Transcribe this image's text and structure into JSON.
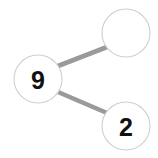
{
  "diagram": {
    "kind": "number-bond",
    "background_color": "#ffffff",
    "circle_fill": "#ffffff",
    "circle_stroke": "#cfcfcf",
    "connector_color": "#9a9a9a",
    "text_color": "#111111",
    "nodes": [
      {
        "id": "whole",
        "role": "whole",
        "label": "9",
        "filled": true,
        "cx": 38,
        "cy": 79,
        "r": 24
      },
      {
        "id": "part-top",
        "role": "part",
        "label": "",
        "filled": false,
        "cx": 126,
        "cy": 33,
        "r": 24
      },
      {
        "id": "part-bottom",
        "role": "part",
        "label": "2",
        "filled": true,
        "cx": 126,
        "cy": 126,
        "r": 24
      }
    ],
    "connectors": [
      {
        "id": "whole-to-part-top",
        "from": "whole",
        "to": "part-top",
        "x1": 58,
        "y1": 66,
        "x2": 107,
        "y2": 47
      },
      {
        "id": "whole-to-part-bottom",
        "from": "whole",
        "to": "part-bottom",
        "x1": 58,
        "y1": 92,
        "x2": 107,
        "y2": 113
      }
    ]
  }
}
